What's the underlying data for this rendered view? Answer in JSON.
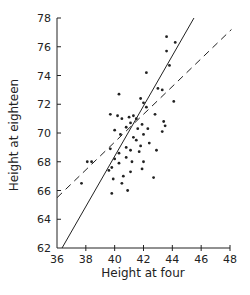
{
  "chart_data": {
    "type": "scatter",
    "title": "",
    "xlabel": "Height at four",
    "ylabel": "Height at eighteen",
    "xlim": [
      36,
      48
    ],
    "ylim": [
      62,
      78
    ],
    "xticks": [
      36,
      38,
      40,
      42,
      44,
      46,
      48
    ],
    "yticks": [
      62,
      64,
      66,
      68,
      70,
      72,
      74,
      76,
      78
    ],
    "grid": false,
    "legend": null,
    "points": [
      [
        43.6,
        76.7
      ],
      [
        44.2,
        76.3
      ],
      [
        43.6,
        75.7
      ],
      [
        43.8,
        74.7
      ],
      [
        42.2,
        74.2
      ],
      [
        43.0,
        73.1
      ],
      [
        43.3,
        73.0
      ],
      [
        40.3,
        72.7
      ],
      [
        41.8,
        72.4
      ],
      [
        42.0,
        72.1
      ],
      [
        42.2,
        71.8
      ],
      [
        44.1,
        72.2
      ],
      [
        42.8,
        71.3
      ],
      [
        43.4,
        70.8
      ],
      [
        39.7,
        71.3
      ],
      [
        40.2,
        71.2
      ],
      [
        40.5,
        71.0
      ],
      [
        41.0,
        71.1
      ],
      [
        41.3,
        71.2
      ],
      [
        41.5,
        71.0
      ],
      [
        41.1,
        70.7
      ],
      [
        40.8,
        70.4
      ],
      [
        41.6,
        70.3
      ],
      [
        41.9,
        70.6
      ],
      [
        42.3,
        70.3
      ],
      [
        40.0,
        70.2
      ],
      [
        40.4,
        69.9
      ],
      [
        41.3,
        69.7
      ],
      [
        41.5,
        69.5
      ],
      [
        41.8,
        69.1
      ],
      [
        42.4,
        69.3
      ],
      [
        43.3,
        70.1
      ],
      [
        40.8,
        69.0
      ],
      [
        41.1,
        68.8
      ],
      [
        41.7,
        68.7
      ],
      [
        40.3,
        68.6
      ],
      [
        40.8,
        68.3
      ],
      [
        41.2,
        68.0
      ],
      [
        42.0,
        68.0
      ],
      [
        42.9,
        68.8
      ],
      [
        39.7,
        68.9
      ],
      [
        40.0,
        68.2
      ],
      [
        39.8,
        67.6
      ],
      [
        40.3,
        67.9
      ],
      [
        41.9,
        67.5
      ],
      [
        40.6,
        67.0
      ],
      [
        41.1,
        67.3
      ],
      [
        39.9,
        66.8
      ],
      [
        40.5,
        66.5
      ],
      [
        42.7,
        66.9
      ],
      [
        38.1,
        68.0
      ],
      [
        38.4,
        68.0
      ],
      [
        37.7,
        66.5
      ],
      [
        39.8,
        65.8
      ],
      [
        40.9,
        66.0
      ],
      [
        39.6,
        67.4
      ],
      [
        42.0,
        69.9
      ],
      [
        43.5,
        70.5
      ]
    ],
    "series": [
      {
        "name": "solid regression line",
        "style": "solid",
        "x": [
          36.35,
          45.5
        ],
        "y": [
          62.0,
          78.0
        ]
      },
      {
        "name": "dashed regression line",
        "style": "dashed",
        "x": [
          36.0,
          48.1
        ],
        "y": [
          65.5,
          77.2
        ]
      }
    ]
  },
  "colors": {
    "ink": "#222222",
    "background": "#ffffff"
  }
}
